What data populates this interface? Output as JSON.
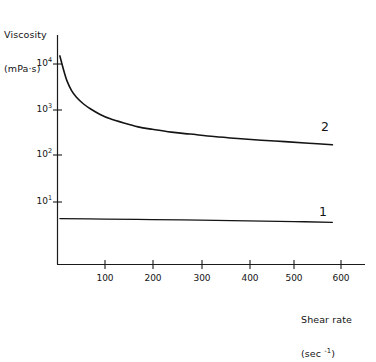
{
  "chart_data": {
    "type": "line",
    "title": "",
    "ylabel_line1": "Viscosity",
    "ylabel_line2_prefix": "(mPa",
    "ylabel_line2_mid": "·",
    "ylabel_line2_suffix": "s)",
    "xlabel_line1": "Shear rate",
    "xlabel_line2_prefix": "(sec ",
    "xlabel_line2_exp": "-1",
    "xlabel_line2_suffix": ")",
    "xscale": "linear",
    "yscale": "log",
    "xlim": [
      0,
      640
    ],
    "ylim": [
      1,
      30000
    ],
    "grid": false,
    "legend": "inline-end-labels",
    "x_ticks": [
      {
        "value": 100,
        "label": "100"
      },
      {
        "value": 200,
        "label": "200"
      },
      {
        "value": 300,
        "label": "300"
      },
      {
        "value": 400,
        "label": "400"
      },
      {
        "value": 500,
        "label": "500"
      },
      {
        "value": 600,
        "label": "600"
      }
    ],
    "y_ticks": [
      {
        "value": 10000,
        "mantissa": "10",
        "exponent": "4"
      },
      {
        "value": 1000,
        "mantissa": "10",
        "exponent": "3"
      },
      {
        "value": 100,
        "mantissa": "10",
        "exponent": "2"
      },
      {
        "value": 10,
        "mantissa": "10",
        "exponent": "1"
      }
    ],
    "series": [
      {
        "name": "2",
        "label": "2",
        "description": "Shear-thinning sample: viscosity falls steeply from ~15000 mPa·s near zero shear to a plateau of ~170 mPa·s at 580 sec-1",
        "x": [
          5,
          10,
          15,
          20,
          30,
          40,
          55,
          70,
          90,
          110,
          140,
          170,
          200,
          240,
          280,
          330,
          380,
          430,
          480,
          530,
          580
        ],
        "y": [
          15000,
          9500,
          6200,
          4300,
          2600,
          1900,
          1350,
          1050,
          800,
          650,
          520,
          430,
          380,
          330,
          300,
          265,
          240,
          220,
          205,
          190,
          175
        ]
      },
      {
        "name": "1",
        "label": "1",
        "description": "Newtonian sample: viscosity nearly constant, ~4.3 mPa·s falling slightly to ~3.6 mPa·s at 580 sec-1",
        "x": [
          5,
          100,
          200,
          300,
          400,
          500,
          580
        ],
        "y": [
          4.35,
          4.25,
          4.15,
          4.02,
          3.9,
          3.75,
          3.62
        ]
      }
    ],
    "annotations": [
      {
        "name": "series-2-label",
        "text": "2",
        "x": 570,
        "y": 440
      },
      {
        "name": "series-1-label",
        "text": "1",
        "x": 560,
        "y": 13
      }
    ]
  }
}
